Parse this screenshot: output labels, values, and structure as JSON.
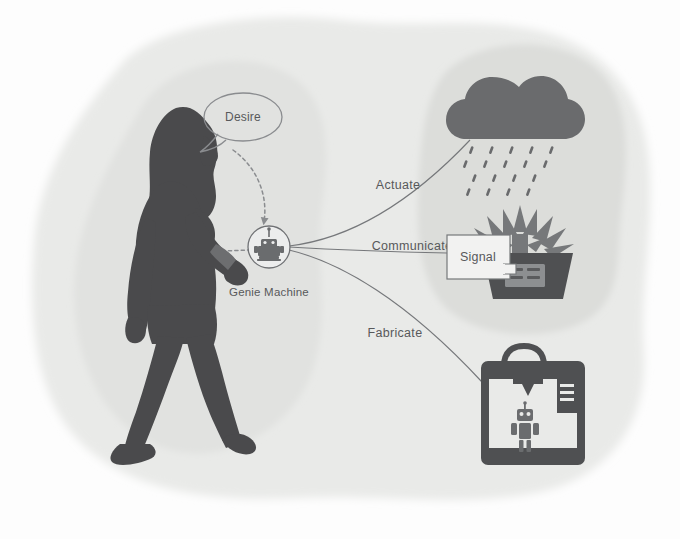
{
  "diagram": {
    "background_color": "#fdfdfd"
  },
  "blobs": {
    "outer_color": "#e9eae8",
    "left_color": "#e0e1df",
    "right_color": "#dcdddb"
  },
  "person": {
    "name": "walking woman silhouette",
    "color": "#4a4a4c",
    "wearable_color": "#6d6e70"
  },
  "speech_bubble": {
    "text": "Desire",
    "stroke_color": "#8a8c8f"
  },
  "node": {
    "label": "Genie Machine",
    "icon": "genie-machine-robot-icon",
    "circle_stroke": "#6f7174",
    "icon_color": "#6a6c6e"
  },
  "branches": [
    {
      "label": "Actuate",
      "target": "rain-cloud-icon",
      "label_x": 398,
      "label_y": 189
    },
    {
      "label": "Communicate",
      "target": "signal-callout",
      "label_x": 412,
      "label_y": 250
    },
    {
      "label": "Fabricate",
      "target": "3d-printer-icon",
      "label_x": 395,
      "label_y": 337
    }
  ],
  "signal_box": {
    "text": "Signal",
    "fill": "#f2f2f1",
    "stroke": "#76787b"
  },
  "icons": {
    "cloud": {
      "name": "rain-cloud-icon",
      "cloud_color": "#6a6b6d",
      "rain_color": "#6a6b6d"
    },
    "plant": {
      "name": "potted-plant-sensor-icon",
      "leaf_color": "#76787a",
      "pot_color": "#4f5052",
      "screen_color": "#8d8f91"
    },
    "printer": {
      "name": "3d-printer-icon",
      "frame_color": "#4f5052",
      "robot_color": "#6a6c6e"
    }
  }
}
